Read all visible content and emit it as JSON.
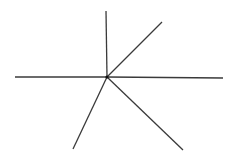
{
  "diagram": {
    "type": "ray-star",
    "background": "#ffffff",
    "stroke_color": "#3a3a3a",
    "stroke_width": 1.3,
    "center": {
      "x": 107,
      "y": 77
    },
    "center_dot_radius": 1.6,
    "rays": [
      {
        "name": "up",
        "x": 106,
        "y": 11
      },
      {
        "name": "upper-right",
        "x": 162,
        "y": 22
      },
      {
        "name": "right",
        "x": 223,
        "y": 78
      },
      {
        "name": "lower-right",
        "x": 183,
        "y": 150
      },
      {
        "name": "lower-left",
        "x": 73,
        "y": 149
      },
      {
        "name": "left",
        "x": 15,
        "y": 77
      }
    ]
  }
}
